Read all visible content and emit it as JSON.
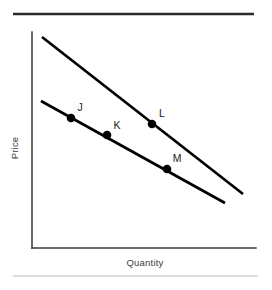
{
  "figure": {
    "title": "",
    "background_color": "#ffffff",
    "width": 272,
    "height": 290
  },
  "rules": {
    "top": {
      "name": "top-divider",
      "color": "#2b2b2b",
      "x1": 13,
      "y1": 14,
      "x2": 254,
      "y2": 14,
      "thickness": 2.6
    },
    "bottom": {
      "name": "bottom-divider",
      "color": "#b9b9b9",
      "x1": 13,
      "y1": 276,
      "x2": 258,
      "y2": 276,
      "thickness": 1.1
    }
  },
  "axes": {
    "color": "#3a3a3a",
    "y_axis": {
      "x": 32,
      "y_top": 32,
      "y_bottom": 248
    },
    "x_axis": {
      "y": 248,
      "x_left": 32,
      "x_right": 256
    },
    "ylabel": "Price",
    "xlabel": "Quantity"
  },
  "chart_data": {
    "type": "line",
    "title": "",
    "xlabel": "Quantity",
    "ylabel": "Price",
    "grid": false,
    "legend": "none",
    "axis_ticks": {
      "x": [],
      "y": []
    },
    "xlim": [
      32,
      256
    ],
    "ylim": [
      32,
      248
    ],
    "note": "Two downward-sloping parallel demand curves drawn in pixel coordinates; the outer (upper-right) curve lies above and to the right of the inner curve.",
    "series": [
      {
        "name": "upper-demand-curve",
        "label": "",
        "color": "#000000",
        "points_px": [
          [
            42,
            37
          ],
          [
            243,
            194
          ]
        ],
        "slope_px": -0.781
      },
      {
        "name": "lower-demand-curve",
        "label": "",
        "color": "#000000",
        "points_px": [
          [
            41,
            101
          ],
          [
            225,
            203
          ]
        ],
        "slope_px": -0.554
      }
    ],
    "annotations": [
      {
        "label": "J",
        "x": 71,
        "y": 118,
        "on_curve": "lower-demand-curve",
        "label_x": 80,
        "label_y": 111
      },
      {
        "label": "K",
        "x": 107,
        "y": 135,
        "on_curve": "lower-demand-curve",
        "label_x": 117,
        "label_y": 129
      },
      {
        "label": "L",
        "x": 152,
        "y": 124,
        "on_curve": "upper-demand-curve",
        "label_x": 162,
        "label_y": 117
      },
      {
        "label": "M",
        "x": 167,
        "y": 169,
        "on_curve": "lower-demand-curve",
        "label_x": 177,
        "label_y": 162
      }
    ],
    "marker": {
      "shape": "circle",
      "radius": 4.3,
      "color": "#000000"
    }
  }
}
